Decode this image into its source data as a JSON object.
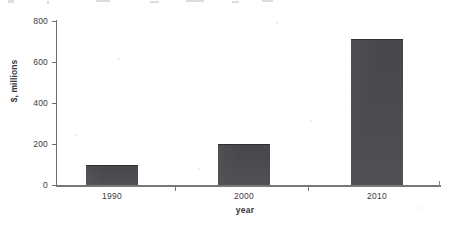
{
  "chart_data": {
    "type": "bar",
    "title": "",
    "categories": [
      "1990",
      "2000",
      "2010"
    ],
    "values": [
      100,
      200,
      710
    ],
    "series": [
      {
        "name": "$, millions",
        "values": [
          100,
          200,
          710
        ]
      }
    ],
    "xlabel": "year",
    "ylabel": "$, millions",
    "ylim": [
      0,
      800
    ],
    "yticks": [
      0,
      200,
      400,
      600,
      800
    ],
    "ytick_labels": [
      "0",
      "200",
      "400",
      "600",
      "800"
    ],
    "xtick_labels": [
      "1990",
      "2000",
      "2010"
    ],
    "grid": false,
    "legend": false,
    "bar_color": "#4a4a4f",
    "axis_color": "#6e6e75",
    "background_color": "#ffffff"
  },
  "axis": {
    "y_title": "$, millions",
    "x_title": "year",
    "y_labels": {
      "t0": "0",
      "t200": "200",
      "t400": "400",
      "t600": "600",
      "t800": "800"
    },
    "x_labels": {
      "c0": "1990",
      "c1": "2000",
      "c2": "2010"
    }
  }
}
